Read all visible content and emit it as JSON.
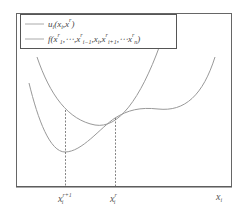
{
  "diagram": {
    "type": "function-curves",
    "legend": {
      "items": [
        {
          "label": "u_i(x_i, x^r)",
          "style": "line",
          "color": "#999999"
        },
        {
          "label": "f(x_1^r, ..., x_{i-1}^r, x_i, x_{i+1}^r, ..., x_n^r)",
          "style": "line",
          "color": "#999999"
        }
      ]
    },
    "axis": {
      "x_label": "x_i",
      "ticks": [
        {
          "label": "x_i^{r+1}",
          "x": 65
        },
        {
          "label": "x_i^r",
          "x": 115
        }
      ]
    },
    "colors": {
      "frame": "#555555",
      "curve": "#999999",
      "dashed": "#666666"
    }
  },
  "labels": {
    "tick1_base": "x",
    "tick1_sub": "i",
    "tick1_sup": "r+1",
    "tick2_base": "x",
    "tick2_sub": "i",
    "tick2_sup": "r",
    "axis_base": "x",
    "axis_sub": "i",
    "legend_u": "u",
    "legend_u_rest": "(x",
    "legend_f": "f(x"
  }
}
